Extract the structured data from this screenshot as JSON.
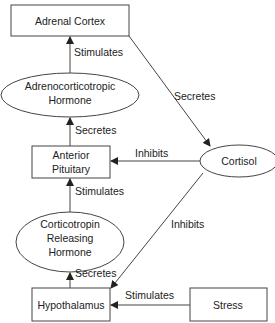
{
  "nodes": {
    "adrenal_cortex": "Adrenal Cortex",
    "acth_line1": "Adrenocorticotropic",
    "acth_line2": "Hormone",
    "anterior_line1": "Anterior",
    "anterior_line2": "Pituitary",
    "cortisol": "Cortisol",
    "crh_line1": "Corticotropin",
    "crh_line2": "Releasing",
    "crh_line3": "Hormone",
    "hypothalamus": "Hypothalamus",
    "stress": "Stress"
  },
  "edges": {
    "acth_to_adrenal": "Stimulates",
    "adrenal_to_cortisol": "Secretes",
    "pituitary_to_acth": "Secretes",
    "cortisol_to_pituitary": "Inhibits",
    "crh_to_pituitary": "Stimulates",
    "cortisol_to_hypothalamus": "Inhibits",
    "hypothalamus_to_crh": "Secretes",
    "stress_to_hypothalamus": "Stimulates"
  }
}
